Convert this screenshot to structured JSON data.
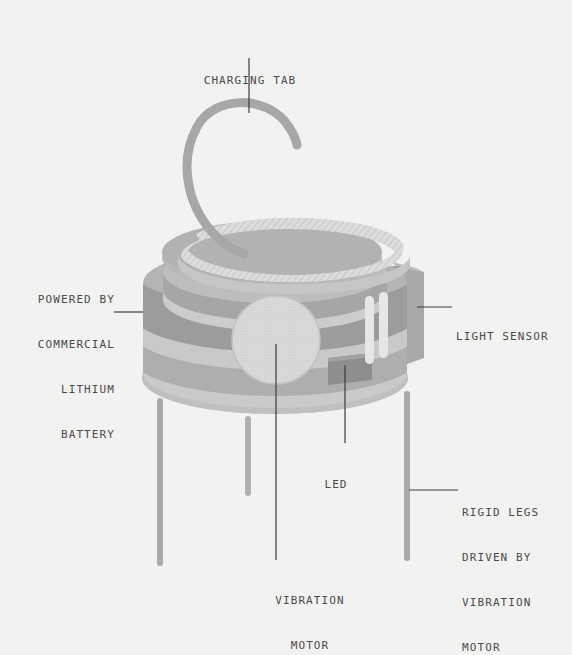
{
  "diagram": {
    "background_color": "#f2f2f0",
    "label_text_color": "#4a4a4a",
    "leader_line_color": "#3c3c3c",
    "palette": {
      "tab_gray": "#a8a8a8",
      "top_disc": "#b4b4b4",
      "hatch_band": "#d8d8d8",
      "body_dark": "#9e9e9e",
      "body_mid": "#b0b0b0",
      "body_light": "#c8c8c8",
      "base_light": "#cdcdcd",
      "motor_fill": "#d2d2d2",
      "sensor_panel": "#9a9a9a",
      "sensor_pillar": "#e4e4e4",
      "led_fill": "#8f8f8f",
      "leg_gray": "#a5a5a5"
    },
    "labels": [
      {
        "id": "charging-tab",
        "name": "charging-tab",
        "lines": [
          "CHARGING TAB"
        ],
        "align": "center"
      },
      {
        "id": "battery",
        "name": "battery",
        "lines": [
          "POWERED BY",
          "COMMERCIAL",
          "LITHIUM",
          "BATTERY"
        ],
        "align": "right"
      },
      {
        "id": "light-sensor",
        "name": "light-sensor",
        "lines": [
          "LIGHT SENSOR"
        ],
        "align": "left"
      },
      {
        "id": "led",
        "name": "led",
        "lines": [
          "LED"
        ],
        "align": "center"
      },
      {
        "id": "rigid-legs",
        "name": "rigid-legs",
        "lines": [
          "RIGID LEGS",
          "DRIVEN BY",
          "VIBRATION",
          "MOTOR"
        ],
        "align": "left"
      },
      {
        "id": "vibration-motor",
        "name": "vibration-motor",
        "lines": [
          "VIBRATION",
          "MOTOR"
        ],
        "align": "center"
      }
    ],
    "parts": [
      {
        "name": "charging-tab-spiral"
      },
      {
        "name": "top-disc"
      },
      {
        "name": "hatched-spiral-band"
      },
      {
        "name": "body-bands"
      },
      {
        "name": "vibration-motor-disc"
      },
      {
        "name": "light-sensor-module"
      },
      {
        "name": "led-block"
      },
      {
        "name": "base-disc"
      },
      {
        "name": "leg-front-left"
      },
      {
        "name": "leg-back-left"
      },
      {
        "name": "leg-front-right"
      }
    ]
  },
  "text": {
    "charging_tab_l1": "CHARGING TAB",
    "battery_l1": "POWERED BY",
    "battery_l2": "COMMERCIAL",
    "battery_l3": "LITHIUM",
    "battery_l4": "BATTERY",
    "light_sensor_l1": "LIGHT SENSOR",
    "led_l1": "LED",
    "rigid_legs_l1": "RIGID LEGS",
    "rigid_legs_l2": "DRIVEN BY",
    "rigid_legs_l3": "VIBRATION",
    "rigid_legs_l4": "MOTOR",
    "vibration_l1": "VIBRATION",
    "vibration_l2": "MOTOR"
  }
}
